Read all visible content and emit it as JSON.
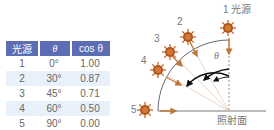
{
  "table": {
    "headers": [
      "光源",
      "θ",
      "cos θ"
    ],
    "header_color": "#5d6db4",
    "rows": [
      {
        "source": "1",
        "theta": "0°",
        "cos": "1.00"
      },
      {
        "source": "2",
        "theta": "30°",
        "cos": "0.87"
      },
      {
        "source": "3",
        "theta": "45°",
        "cos": "0.71"
      },
      {
        "source": "4",
        "theta": "60°",
        "cos": "0.50"
      },
      {
        "source": "5",
        "theta": "90°",
        "cos": "0.00"
      }
    ]
  },
  "diagram": {
    "source_label": "1 光源",
    "source_numbers": [
      "1",
      "2",
      "3",
      "4",
      "5"
    ],
    "angle_label": "θ",
    "surface_label": "照射面",
    "sun_color": "#c45a1a",
    "arrow_color": "#c07838"
  }
}
